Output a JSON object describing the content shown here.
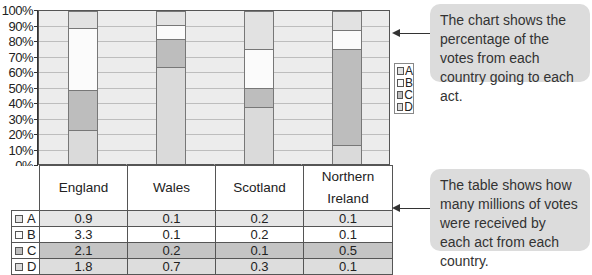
{
  "chart_data": {
    "type": "bar",
    "stacked": true,
    "normalized_percent": true,
    "title": "",
    "xlabel": "",
    "ylabel": "",
    "ylim": [
      0,
      100
    ],
    "y_ticks": [
      "0%",
      "10%",
      "20%",
      "30%",
      "40%",
      "50%",
      "60%",
      "70%",
      "80%",
      "90%",
      "100%"
    ],
    "grid": true,
    "legend_position": "right",
    "categories": [
      "England",
      "Wales",
      "Scotland",
      "Northern Ireland"
    ],
    "series": [
      {
        "name": "A",
        "values": [
          0.9,
          0.1,
          0.2,
          0.1
        ],
        "percent": [
          11.1,
          9.1,
          25.0,
          12.5
        ],
        "color": "#e2e2e2"
      },
      {
        "name": "B",
        "values": [
          3.3,
          0.1,
          0.2,
          0.1
        ],
        "percent": [
          40.7,
          9.1,
          25.0,
          12.5
        ],
        "color": "#fbfbfb"
      },
      {
        "name": "C",
        "values": [
          2.1,
          0.2,
          0.1,
          0.5
        ],
        "percent": [
          25.9,
          18.2,
          12.5,
          62.5
        ],
        "color": "#bdbdbd"
      },
      {
        "name": "D",
        "values": [
          1.8,
          0.7,
          0.3,
          0.1
        ],
        "percent": [
          22.2,
          63.6,
          37.5,
          12.5
        ],
        "color": "#dadada"
      }
    ],
    "units": "millions of votes"
  },
  "table": {
    "headers": [
      "England",
      "Wales",
      "Scotland",
      "Northern Ireland"
    ],
    "rows": [
      {
        "label": "A",
        "cells": [
          "0.9",
          "0.1",
          "0.2",
          "0.1"
        ],
        "bg": "#e6e6e6"
      },
      {
        "label": "B",
        "cells": [
          "3.3",
          "0.1",
          "0.2",
          "0.1"
        ],
        "bg": "#ffffff"
      },
      {
        "label": "C",
        "cells": [
          "2.1",
          "0.2",
          "0.1",
          "0.5"
        ],
        "bg": "#c4c4c4"
      },
      {
        "label": "D",
        "cells": [
          "1.8",
          "0.7",
          "0.3",
          "0.1"
        ],
        "bg": "#dddddd"
      }
    ]
  },
  "legend": {
    "items": [
      "A",
      "B",
      "C",
      "D"
    ]
  },
  "callouts": {
    "chart_note": "The chart shows the percentage of the votes from each country going to each act.",
    "table_note": "The table shows how many millions of votes were received by each act from each country."
  }
}
